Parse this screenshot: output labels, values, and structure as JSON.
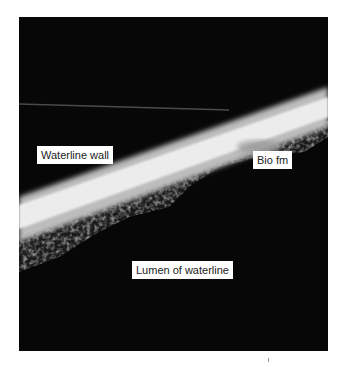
{
  "figure": {
    "labels": {
      "wall": "Waterline wall",
      "biofilm": "Bio fm",
      "lumen": "Lumen of waterline"
    },
    "colors": {
      "background": "#070707",
      "wall": "#e6e6e6",
      "label_bg": "#ffffff",
      "label_text": "#222222"
    }
  }
}
